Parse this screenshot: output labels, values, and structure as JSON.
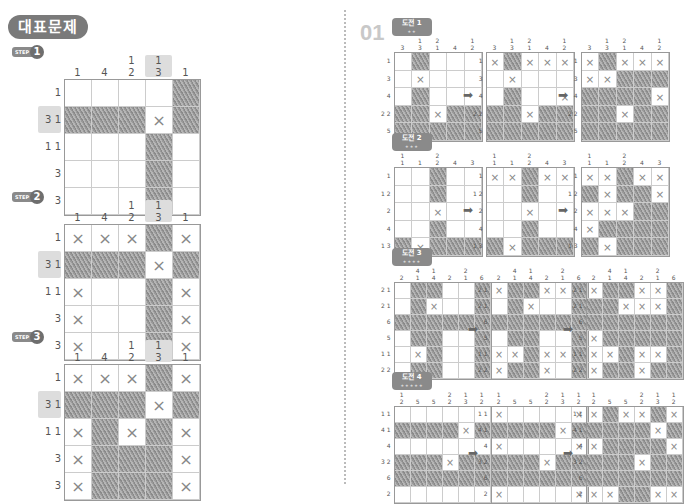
{
  "header": {
    "title": "대표문제",
    "problem_number": "01"
  },
  "steps": [
    {
      "label": "STEP",
      "number": "1"
    },
    {
      "label": "STEP",
      "number": "2"
    },
    {
      "label": "STEP",
      "number": "3"
    }
  ],
  "example_puzzle": {
    "col_clues": [
      "1",
      "4",
      "1\n2",
      "1\n3",
      "1"
    ],
    "row_clues": [
      "1",
      "3 1",
      "1 1",
      "3",
      "3"
    ],
    "highlight_col": 3,
    "highlight_row": 1,
    "states": [
      [
        "....f",
        "fffxf",
        "...f.",
        "...f.",
        "...f."
      ],
      [
        "xxxfx",
        "fffxf",
        "x..fx",
        "x..fx",
        "x..fx"
      ],
      [
        "xxxfx",
        "fffxf",
        "xfxfx",
        "xfffx",
        "xfffx"
      ]
    ]
  },
  "challenges": [
    {
      "label": "도전",
      "number": "1",
      "stars": "★★",
      "col_clues": [
        "3",
        "1\n3",
        "2\n1",
        "4",
        "1\n2"
      ],
      "row_clues": [
        "1",
        "3",
        "4",
        "2 2",
        "5"
      ],
      "states": [
        [
          ".f...",
          ".x...",
          ".f...",
          "ffxff",
          "fffff"
        ],
        [
          "xfxxx",
          ".x...",
          ".f..x",
          "ffxff",
          "fffff"
        ],
        [
          "xfxxx",
          "xxfff",
          "ffffx",
          "ffxff",
          "fffff"
        ]
      ]
    },
    {
      "label": "도전",
      "number": "2",
      "stars": "★★★",
      "col_clues": [
        "1\n1",
        "1",
        "2\n2",
        "4",
        "3"
      ],
      "row_clues": [
        "1",
        "1 2",
        "2",
        "4",
        "1 3"
      ],
      "states": [
        [
          "..f..",
          "..f..",
          "..x..",
          "..f..",
          "fxfff"
        ],
        [
          "xxfxx",
          "..f..",
          "..x..",
          "..f..",
          "fxfff"
        ],
        [
          "xxfxx",
          "fxffx",
          "xxxff",
          "xffff",
          "fxfff"
        ]
      ]
    },
    {
      "label": "도전",
      "number": "3",
      "stars": "★★★★",
      "col_clues": [
        "2",
        "4\n1",
        "1\n4",
        "2",
        "2\n1",
        "6"
      ],
      "row_clues": [
        "2 1",
        "2 1",
        "6",
        "5",
        "1 1",
        "2 2"
      ],
      "states": [
        [
          ".ff..f",
          ".fx..f",
          "ffffff",
          ".ff..f",
          ".xf..f",
          ".ff..f"
        ],
        [
          "xffxxf",
          ".fx..f",
          "ffffff",
          ".ff..f",
          "xxfxxf",
          "xffx.f"
        ],
        [
          "xffxxf",
          "ffxxxf",
          "ffffff",
          "xfffff",
          "xxfxxf",
          "xffxff"
        ]
      ]
    },
    {
      "label": "도전",
      "number": "4",
      "stars": "★★★★★",
      "col_clues": [
        "1\n2",
        "5",
        "5",
        "2\n2",
        "1\n3",
        "1\n2"
      ],
      "row_clues": [
        "1 1",
        "4 1",
        "4",
        "3 2",
        "6",
        "2"
      ],
      "states": [
        [
          "......",
          "ffffxf",
          "......",
          "fffxff",
          "ffffff",
          "......"
        ],
        [
          "x....x",
          "ffffxf",
          "x....x",
          "fffxff",
          "ffffff",
          "x....x"
        ],
        [
          "xfxxfx",
          "ffffxf",
          "xffffx",
          "fffxff",
          "ffffff",
          "xxffxx"
        ]
      ]
    }
  ],
  "icons": {
    "arrow": "➡",
    "cross": "×"
  }
}
